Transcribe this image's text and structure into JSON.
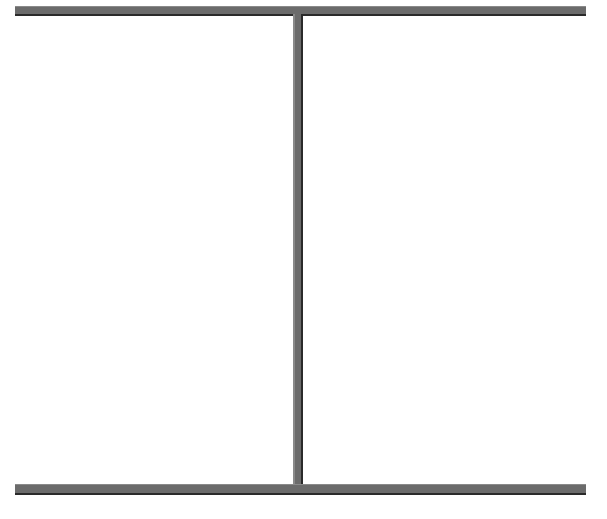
{
  "diagram": {
    "type": "i-beam-frame",
    "colors": {
      "bar": "#6b6b6b",
      "edge_dark": "#2a2a2a",
      "edge_light": "#8a8a8a",
      "background": "#ffffff"
    },
    "elements": [
      {
        "id": "top-bar",
        "x": 15,
        "y": 6,
        "w": 571,
        "h": 10
      },
      {
        "id": "vertical-divider",
        "x": 293,
        "y": 14,
        "w": 10,
        "h": 472
      },
      {
        "id": "bottom-bar",
        "x": 15,
        "y": 484,
        "w": 571,
        "h": 11
      }
    ],
    "panels": [
      {
        "id": "left-panel",
        "label": ""
      },
      {
        "id": "right-panel",
        "label": ""
      }
    ]
  }
}
